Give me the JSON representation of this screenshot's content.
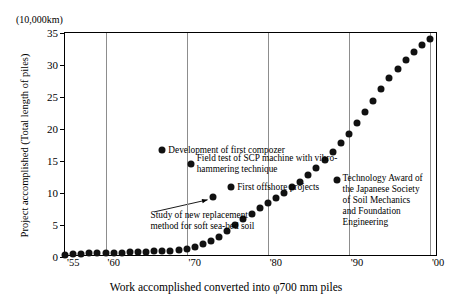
{
  "axis_unit_note": "(10,000km)",
  "y_axis_title": "Project accomplished (Total length of piles)",
  "x_axis_title": "Work accomplished converted into φ700 mm piles",
  "y_ticks": [
    "0",
    "5",
    "10",
    "15",
    "20",
    "25",
    "30",
    "35"
  ],
  "x_ticks": [
    "'55",
    "'60",
    "'70",
    "'80",
    "'90",
    "'00"
  ],
  "annotations": [
    {
      "id": "composer",
      "text": "Development of first compozer",
      "x": 1967,
      "y": 16.7
    },
    {
      "id": "scp",
      "text": "Field test of SCP machine with vibro-\nhammering technique",
      "x": 1970.5,
      "y": 14.6
    },
    {
      "id": "offshore",
      "text": "First offshore projects",
      "x": 1975.5,
      "y": 11.0
    },
    {
      "id": "award",
      "text": "Technology Award of\nthe Japanese Society\nof Soil Mechanics\nand Foundation\nEngineering",
      "x": 1988.5,
      "y": 12.0
    }
  ],
  "leader_annotation": {
    "text": "Study of new replacement\nmethod for soft sea-bed soil",
    "target_x": 1973.2,
    "target_y": 9.4
  },
  "chart_data": {
    "type": "scatter",
    "title": "",
    "subtitle": "",
    "xlabel": "Work accomplished converted into φ700 mm piles",
    "ylabel": "Project accomplished (Total length of piles)",
    "unit": "(10,000km)",
    "xlim": [
      1955,
      2001
    ],
    "ylim": [
      0,
      35
    ],
    "grid": "vertical",
    "legend": "none",
    "x_tick_values": [
      1955,
      1960,
      1970,
      1980,
      1990,
      2000
    ],
    "x_tick_labels": [
      "'55",
      "'60",
      "'70",
      "'80",
      "'90",
      "'00"
    ],
    "y_tick_values": [
      0,
      5,
      10,
      15,
      20,
      25,
      30,
      35
    ],
    "y_tick_labels": [
      "0",
      "5",
      "10",
      "15",
      "20",
      "25",
      "30",
      "35"
    ],
    "x": [
      1955,
      1956,
      1957,
      1958,
      1959,
      1960,
      1961,
      1962,
      1963,
      1964,
      1965,
      1966,
      1967,
      1968,
      1969,
      1970,
      1971,
      1972,
      1973,
      1974,
      1975,
      1976,
      1977,
      1978,
      1979,
      1980,
      1981,
      1982,
      1983,
      1984,
      1985,
      1986,
      1987,
      1988,
      1989,
      1990,
      1991,
      1992,
      1993,
      1994,
      1995,
      1996,
      1997,
      1998,
      1999,
      2000
    ],
    "values": [
      0.3,
      0.4,
      0.5,
      0.6,
      0.6,
      0.7,
      0.7,
      0.7,
      0.8,
      0.8,
      0.8,
      0.9,
      0.9,
      1.0,
      1.1,
      1.3,
      1.6,
      2.0,
      2.5,
      3.2,
      4.1,
      5.0,
      5.9,
      6.8,
      7.6,
      8.4,
      9.2,
      10.0,
      10.9,
      11.8,
      12.8,
      13.9,
      15.1,
      16.4,
      17.8,
      19.3,
      20.9,
      22.6,
      24.4,
      26.2,
      27.9,
      29.4,
      30.8,
      32.0,
      33.1,
      34.0
    ]
  }
}
